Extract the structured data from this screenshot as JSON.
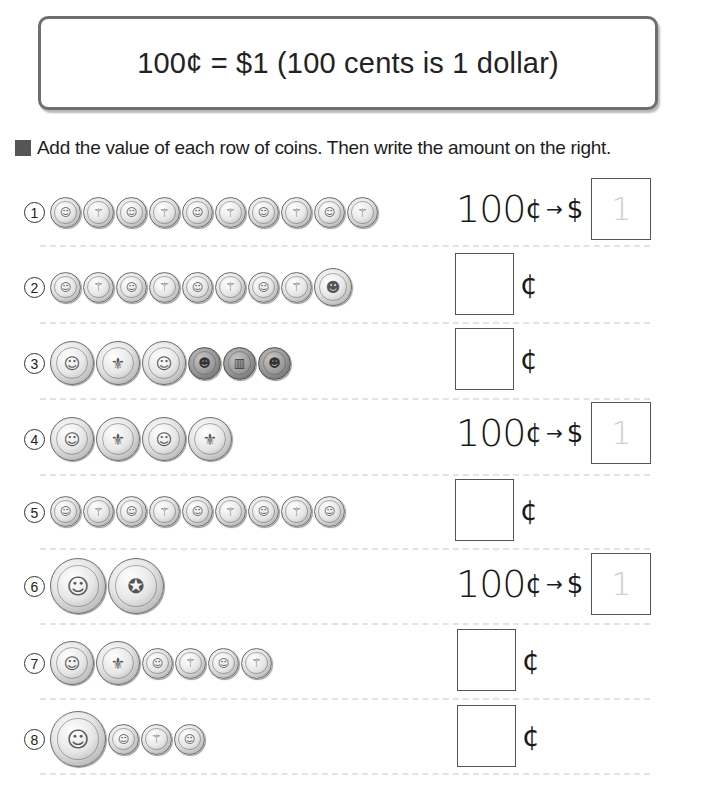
{
  "rule_box": {
    "text": "100¢ = $1  (100 cents is 1 dollar)"
  },
  "instruction": {
    "text": "Add the value of each row of coins. Then write the amount on the right."
  },
  "coin_labels": {
    "dime_heads": "D",
    "dime_tails": "⚚",
    "nickel": "N",
    "quarter_heads": "Q",
    "quarter_tails": "⚜",
    "penny_heads": "L",
    "penny_tails": "▥",
    "half_heads": "K",
    "half_tails": "✪"
  },
  "symbols": {
    "hundred": "100",
    "cent": "¢",
    "arrow": "→",
    "dollar": "$",
    "hint_one": "1"
  },
  "rows": [
    {
      "number": "1",
      "coins": [
        "dime",
        "dime",
        "dime",
        "dime",
        "dime",
        "dime",
        "dime",
        "dime",
        "dime",
        "dime"
      ],
      "answer_type": "dollar",
      "hint": "1"
    },
    {
      "number": "2",
      "coins": [
        "dime",
        "dime",
        "dime",
        "dime",
        "dime",
        "dime",
        "dime",
        "dime",
        "nickel"
      ],
      "answer_type": "cent",
      "hint": ""
    },
    {
      "number": "3",
      "coins": [
        "quarter",
        "quarter",
        "quarter",
        "penny",
        "penny",
        "penny"
      ],
      "answer_type": "cent",
      "hint": ""
    },
    {
      "number": "4",
      "coins": [
        "quarter",
        "quarter",
        "quarter",
        "quarter"
      ],
      "answer_type": "dollar",
      "hint": "1"
    },
    {
      "number": "5",
      "coins": [
        "dime",
        "dime",
        "dime",
        "dime",
        "dime",
        "dime",
        "dime",
        "dime",
        "dime"
      ],
      "answer_type": "cent",
      "hint": ""
    },
    {
      "number": "6",
      "coins": [
        "half-dollar",
        "half-dollar"
      ],
      "answer_type": "dollar",
      "hint": "1"
    },
    {
      "number": "7",
      "coins": [
        "quarter",
        "quarter",
        "dime",
        "dime",
        "dime",
        "dime"
      ],
      "answer_type": "cent",
      "hint": ""
    },
    {
      "number": "8",
      "coins": [
        "half-dollar",
        "dime",
        "dime",
        "dime"
      ],
      "answer_type": "cent",
      "hint": ""
    }
  ]
}
